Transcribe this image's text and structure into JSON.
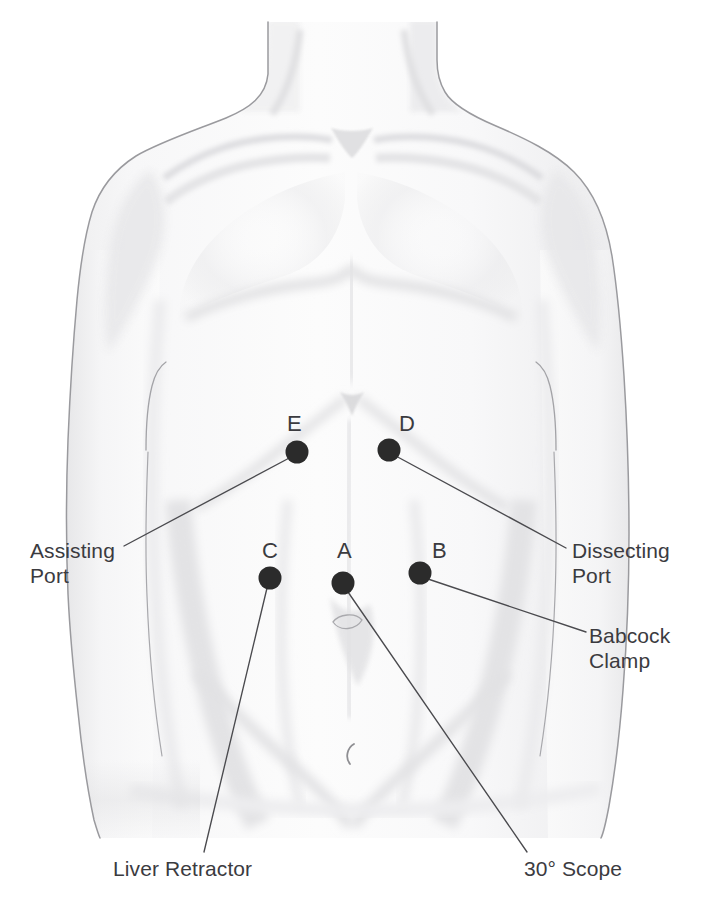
{
  "figure": {
    "style": "grayscale medical line illustration"
  },
  "colors": {
    "background": "#ffffff",
    "skin_light": "#fbfbfb",
    "skin_shade": "#ececed",
    "skin_shade_deep": "#e0e0e2",
    "outline": "#8d8d91",
    "outline_dark": "#6e6e73",
    "port_dot": "#2b2b2b",
    "leader_line": "#4a4a4e",
    "text": "#3b3b3f"
  },
  "ports": [
    {
      "id": "port-a",
      "letter": "A",
      "letter_x": 337,
      "letter_y": 551,
      "dot_x": 343,
      "dot_y": 583,
      "radius": 11,
      "label": "30° Scope",
      "label_lines": [
        "30° Scope"
      ],
      "leader_to_x": 527,
      "leader_to_y": 852
    },
    {
      "id": "port-b",
      "letter": "B",
      "letter_x": 432,
      "letter_y": 551,
      "dot_x": 420,
      "dot_y": 573,
      "radius": 11,
      "label": "Babcock Clamp",
      "label_lines": [
        "Babcock",
        "Clamp"
      ],
      "leader_to_x": 586,
      "leader_to_y": 632
    },
    {
      "id": "port-c",
      "letter": "C",
      "letter_x": 262,
      "letter_y": 551,
      "dot_x": 270,
      "dot_y": 578,
      "radius": 11,
      "label": "Liver Retractor",
      "label_lines": [
        "Liver Retractor"
      ],
      "leader_to_x": 204,
      "leader_to_y": 852
    },
    {
      "id": "port-d",
      "letter": "D",
      "letter_x": 399,
      "letter_y": 424,
      "dot_x": 389,
      "dot_y": 450,
      "radius": 11,
      "label": "Dissecting Port",
      "label_lines": [
        "Dissecting",
        "Port"
      ],
      "leader_to_x": 566,
      "leader_to_y": 548
    },
    {
      "id": "port-e",
      "letter": "E",
      "letter_x": 287,
      "letter_y": 424,
      "dot_x": 297,
      "dot_y": 452,
      "radius": 11,
      "label": "Assisting Port",
      "label_lines": [
        "Assisting",
        "Port"
      ],
      "leader_to_x": 124,
      "leader_to_y": 546
    }
  ],
  "annotations": [
    {
      "id": "annotation-assisting-port",
      "text": "Assisting\nPort",
      "x": 30,
      "y": 538,
      "align": "left",
      "for_port": "E"
    },
    {
      "id": "annotation-dissecting-port",
      "text": "Dissecting\nPort",
      "x": 572,
      "y": 538,
      "align": "left",
      "for_port": "D"
    },
    {
      "id": "annotation-babcock-clamp",
      "text": "Babcock\nClamp",
      "x": 589,
      "y": 623,
      "align": "left",
      "for_port": "B"
    },
    {
      "id": "annotation-liver-retractor",
      "text": "Liver Retractor",
      "x": 113,
      "y": 856,
      "align": "left",
      "for_port": "C"
    },
    {
      "id": "annotation-30-scope",
      "text": "30° Scope",
      "x": 524,
      "y": 856,
      "align": "left",
      "for_port": "A"
    }
  ],
  "anatomy_marks": [
    {
      "id": "navel",
      "x": 347,
      "y": 752,
      "glyph": "C"
    },
    {
      "id": "umbilicus-upper",
      "x": 345,
      "y": 622,
      "glyph": "oval"
    }
  ]
}
